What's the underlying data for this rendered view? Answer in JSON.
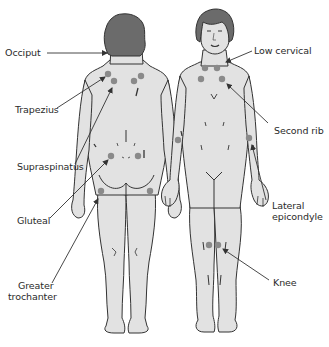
{
  "figure": {
    "type": "tender-points-diagram",
    "views": [
      "posterior",
      "anterior"
    ],
    "colors": {
      "skin": "#e2e2e2",
      "outline": "#333333",
      "hair": "#6b6b6b",
      "tender_point": "#8a8a8a",
      "leader_line": "#333333"
    }
  },
  "labels": {
    "left": [
      {
        "id": "occiput",
        "text": "Occiput"
      },
      {
        "id": "trapezius",
        "text": "Trapezius"
      },
      {
        "id": "supraspinatus",
        "text": "Supraspinatus"
      },
      {
        "id": "gluteal",
        "text": "Gluteal"
      },
      {
        "id": "greater_trochanter_1",
        "text": "Greater"
      },
      {
        "id": "greater_trochanter_2",
        "text": "trochanter"
      }
    ],
    "right": [
      {
        "id": "low_cervical",
        "text": "Low cervical"
      },
      {
        "id": "second_rib",
        "text": "Second rib"
      },
      {
        "id": "lateral_epicondyle_1",
        "text": "Lateral"
      },
      {
        "id": "lateral_epicondyle_2",
        "text": "epicondyle"
      },
      {
        "id": "knee",
        "text": "Knee"
      }
    ]
  }
}
